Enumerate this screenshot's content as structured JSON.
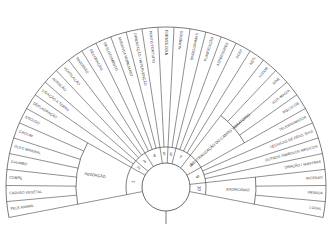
{
  "diagram": {
    "type": "radial fan diagram",
    "center": [
      166,
      187
    ],
    "inner_radius": 24,
    "ring_outer_radius": 40,
    "outer_radius": 160,
    "start_angle": -101,
    "end_angle": 101,
    "sectors": [
      {
        "number": "1",
        "group": "ABSORÇÃO",
        "items": [
          "PELE ANIMAL",
          "CARVÃO VEGETAL",
          "COBRE",
          "CHUMBO",
          "ÓLEO MINERAL",
          "CAOLIM",
          "ESCUDO"
        ]
      },
      {
        "number": "2",
        "group": "",
        "items": [
          "DEFLAGRAÇÃO",
          "LIGAÇÃO À TERRA"
        ]
      },
      {
        "number": "3",
        "group": "",
        "items": [
          "AERAÇÃO",
          "VENTILAÇÃO",
          "INVERSÃO"
        ]
      },
      {
        "number": "4",
        "group": "",
        "items": [
          "DECORAÇÃO",
          "DESLOCAMENTO",
          "MUDANÇA MOBILIÁRIO",
          "ORIENTAÇÃO / INTERVENÇÃO"
        ]
      },
      {
        "number": "5",
        "group": "",
        "items": [
          "PONTO FORTUITO",
          "FORMOLOGIA"
        ]
      },
      {
        "number": "6",
        "group": "",
        "items": [
          "NÚMEROS",
          "RADIOGRAMAS"
        ]
      },
      {
        "number": "7",
        "group": "",
        "items": [
          "PURIFICAÇÃO",
          "ASPERSORES",
          "SCAP",
          "NETI"
        ]
      },
      {
        "number": "8",
        "group": "NEUTRALIZAÇÃO DO CAMPO VIBRATÓRIO",
        "items": [
          "LUDOR",
          "XINE",
          "ANTI-MAGIA",
          "BISCÚLOS"
        ]
      },
      {
        "number": "9",
        "group": "",
        "items": [
          "TELEBRAMADOR",
          "TÉCNICAS DE FENG SHUI",
          "OUTROS SÍMBOLOS MÁGICOS",
          "ORAÇÃO / MANTRAS"
        ]
      },
      {
        "number": "10",
        "group": "EXORCISMO",
        "items": [
          "INCENSO",
          "PESSOA",
          "LOCAL"
        ]
      }
    ]
  },
  "colors": {
    "line": "#444444",
    "text": "#3a3a3a",
    "background": "#ffffff"
  }
}
